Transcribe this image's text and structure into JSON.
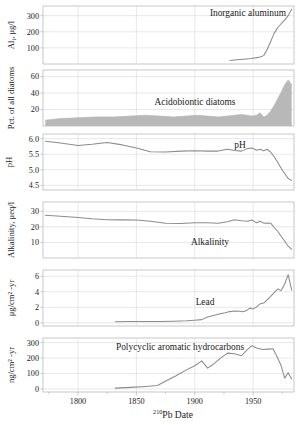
{
  "figure": {
    "xaxis_title_prefix": "210",
    "xaxis_title_main": "Pb Date",
    "xaxis_title_full": "210Pb Date",
    "xlim": [
      1770,
      1985
    ],
    "xticks": [
      1800,
      1850,
      1900,
      1950
    ],
    "xtick_labels": [
      "1800",
      "1850",
      "1900",
      "1950"
    ],
    "series_color": "#8c8c8c",
    "fill_color": "#b8b8b8",
    "grid_color": "#d9d9d9",
    "frame_color": "#b0b0b0",
    "text_color": "#1a1a1a"
  },
  "chart_data": [
    {
      "type": "line",
      "id": "inorganic-aluminum",
      "title": "Inorganic aluminum",
      "ylabel_main": "Al",
      "ylabel_sub": "i",
      "ylabel_unit": ", μg/l",
      "ylabel_full": "Ali, μg/l",
      "xlabel": "",
      "ylim": [
        0,
        360
      ],
      "yticks": [
        100,
        200,
        300
      ],
      "ytick_labels": [
        "100",
        "200",
        "300"
      ],
      "grid": true,
      "x": [
        1930,
        1936,
        1942,
        1948,
        1952,
        1956,
        1959,
        1962,
        1965,
        1968,
        1971,
        1974,
        1977,
        1980,
        1983
      ],
      "values": [
        22,
        26,
        30,
        34,
        38,
        44,
        52,
        90,
        140,
        190,
        225,
        250,
        272,
        300,
        340
      ]
    },
    {
      "type": "area",
      "id": "acidobiontic-diatoms",
      "title": "Acidobiontic diatoms",
      "ylabel_full": "Pct. of all diatoms",
      "xlabel": "",
      "ylim": [
        0,
        68
      ],
      "yticks": [
        20,
        40,
        60
      ],
      "ytick_labels": [
        "20",
        "40",
        "60"
      ],
      "grid": true,
      "x": [
        1772,
        1785,
        1800,
        1815,
        1830,
        1845,
        1858,
        1870,
        1882,
        1893,
        1902,
        1911,
        1920,
        1928,
        1934,
        1940,
        1945,
        1949,
        1953,
        1956,
        1959,
        1962,
        1965,
        1968,
        1971,
        1974,
        1977,
        1980,
        1983
      ],
      "values": [
        7,
        9,
        10,
        11,
        11,
        12,
        13,
        12,
        11,
        12,
        13,
        12,
        11,
        12,
        13,
        14,
        13,
        12,
        13,
        16,
        11,
        13,
        18,
        25,
        33,
        41,
        50,
        56,
        50
      ]
    },
    {
      "type": "line",
      "id": "ph",
      "title": "pH",
      "ylabel_full": "pH",
      "xlabel": "",
      "ylim": [
        4.35,
        6.15
      ],
      "yticks": [
        4.5,
        5.0,
        5.5,
        6.0
      ],
      "ytick_labels": [
        "4.5",
        "5.0",
        "5.5",
        "6.0"
      ],
      "grid": true,
      "x": [
        1772,
        1785,
        1800,
        1812,
        1825,
        1838,
        1850,
        1862,
        1875,
        1888,
        1900,
        1911,
        1920,
        1928,
        1934,
        1940,
        1945,
        1949,
        1953,
        1956,
        1959,
        1962,
        1965,
        1968,
        1971,
        1974,
        1977,
        1980,
        1983
      ],
      "values": [
        5.92,
        5.86,
        5.78,
        5.82,
        5.88,
        5.8,
        5.7,
        5.58,
        5.57,
        5.6,
        5.61,
        5.6,
        5.6,
        5.66,
        5.62,
        5.6,
        5.68,
        5.7,
        5.63,
        5.66,
        5.61,
        5.66,
        5.57,
        5.42,
        5.24,
        5.05,
        4.88,
        4.72,
        4.66
      ]
    },
    {
      "type": "line",
      "id": "alkalinity",
      "title": "Alkalinity",
      "ylabel_full": "Alkalinity, μeq/l",
      "xlabel": "",
      "ylim": [
        0,
        36
      ],
      "yticks": [
        10,
        20,
        30
      ],
      "ytick_labels": [
        "10",
        "20",
        "30"
      ],
      "grid": true,
      "x": [
        1772,
        1785,
        1800,
        1812,
        1825,
        1838,
        1850,
        1862,
        1875,
        1888,
        1900,
        1911,
        1920,
        1928,
        1934,
        1940,
        1945,
        1949,
        1953,
        1956,
        1959,
        1962,
        1965,
        1968,
        1971,
        1974,
        1977,
        1980,
        1983
      ],
      "values": [
        27.5,
        26.8,
        26.0,
        25.2,
        24.6,
        24.5,
        24.4,
        23.6,
        22.4,
        22.2,
        22.6,
        22.6,
        22.3,
        23.3,
        24.6,
        24.0,
        23.6,
        24.4,
        22.6,
        23.6,
        22.4,
        22.5,
        22.4,
        19.6,
        17.2,
        14.0,
        10.8,
        7.6,
        5.6
      ]
    },
    {
      "type": "line",
      "id": "lead",
      "title": "Lead",
      "ylabel_full": "μg/cm² -yr",
      "xlabel": "",
      "ylim": [
        -0.4,
        6.8
      ],
      "yticks": [
        0,
        2,
        4,
        6
      ],
      "ytick_labels": [
        "0",
        "2",
        "4",
        "6"
      ],
      "grid": true,
      "x": [
        1832,
        1845,
        1858,
        1870,
        1882,
        1893,
        1900,
        1906,
        1911,
        1916,
        1921,
        1926,
        1930,
        1934,
        1938,
        1941,
        1944,
        1947,
        1950,
        1953,
        1956,
        1959,
        1962,
        1965,
        1968,
        1971,
        1974,
        1977,
        1980,
        1983
      ],
      "values": [
        0.15,
        0.17,
        0.18,
        0.18,
        0.22,
        0.28,
        0.35,
        0.42,
        0.75,
        0.95,
        1.15,
        1.3,
        1.45,
        1.52,
        1.5,
        1.42,
        1.55,
        1.9,
        1.8,
        2.05,
        2.45,
        2.55,
        2.95,
        3.4,
        3.9,
        4.35,
        4.15,
        5.0,
        6.2,
        4.2
      ]
    },
    {
      "type": "line",
      "id": "polycyclic-aromatic-hydrocarbons",
      "title": "Polycyclic aromatic hydrocarbons",
      "ylabel_full": "ng/cm² -yr",
      "xlabel": "",
      "ylim": [
        -20,
        330
      ],
      "yticks": [
        0,
        100,
        200,
        300
      ],
      "ytick_labels": [
        "0",
        "100",
        "200",
        "300"
      ],
      "grid": true,
      "x": [
        1832,
        1845,
        1858,
        1868,
        1876,
        1884,
        1892,
        1900,
        1906,
        1911,
        1916,
        1922,
        1928,
        1934,
        1940,
        1945,
        1949,
        1953,
        1958,
        1963,
        1967,
        1971,
        1974,
        1977,
        1980,
        1983
      ],
      "values": [
        5,
        10,
        16,
        22,
        55,
        85,
        120,
        150,
        182,
        135,
        160,
        200,
        232,
        228,
        215,
        255,
        280,
        265,
        255,
        258,
        260,
        200,
        150,
        70,
        105,
        65
      ]
    }
  ]
}
